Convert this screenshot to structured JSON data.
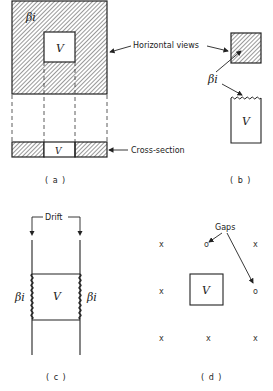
{
  "panels": {
    "a": {
      "caption": "( a )",
      "beta_label": "βi",
      "volume_label": "V",
      "cross_volume_label": "V",
      "horizontal_views_label": "Horizontal views",
      "cross_section_label": "Cross-section"
    },
    "b": {
      "caption": "( b )",
      "beta_label": "βi",
      "volume_label": "V"
    },
    "c": {
      "caption": "( c )",
      "drift_label": "Drift",
      "beta_left": "βi",
      "beta_right": "βi",
      "volume_label": "V"
    },
    "d": {
      "caption": "( d )",
      "gaps_label": "Gaps",
      "volume_label": "V",
      "grid_marks": [
        {
          "row": 0,
          "col": 0,
          "symbol": "x"
        },
        {
          "row": 0,
          "col": 1,
          "symbol": "o"
        },
        {
          "row": 0,
          "col": 2,
          "symbol": "x"
        },
        {
          "row": 1,
          "col": 0,
          "symbol": "x"
        },
        {
          "row": 1,
          "col": 2,
          "symbol": "o"
        },
        {
          "row": 2,
          "col": 0,
          "symbol": "x"
        },
        {
          "row": 2,
          "col": 1,
          "symbol": "x"
        },
        {
          "row": 2,
          "col": 2,
          "symbol": "x"
        }
      ]
    }
  },
  "colors": {
    "ink": "#222222",
    "background": "#ffffff"
  }
}
